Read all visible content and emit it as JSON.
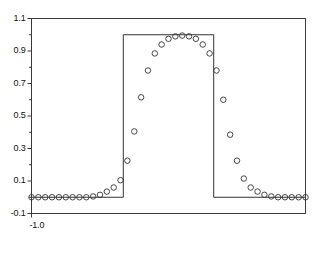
{
  "chart_data": {
    "type": "line",
    "title": "",
    "subtitle": "",
    "xlabel": "",
    "ylabel": "",
    "xlim": [
      -1.0,
      1.0
    ],
    "ylim": [
      -0.1,
      1.1
    ],
    "grid": false,
    "legend": "none",
    "frame": true,
    "y_ticks": [
      -0.1,
      0.1,
      0.3,
      0.5,
      0.7,
      0.9,
      1.1
    ],
    "y_tick_labels": [
      "-0.1",
      "0.1",
      "0.3",
      "0.5",
      "0.7",
      "0.9",
      "1.1"
    ],
    "y_minor_ticks": [
      0.0,
      0.2,
      0.4,
      0.6,
      0.8,
      1.0
    ],
    "x_ticks": [
      -1.0
    ],
    "x_tick_labels": [
      "-1.0"
    ],
    "series": [
      {
        "name": "square wave",
        "style": "line",
        "color": "#333333",
        "linewidth": 1,
        "x": [
          -1.0,
          -0.33,
          -0.33,
          0.33,
          0.33,
          1.0
        ],
        "values": [
          0.0,
          0.0,
          1.0,
          1.0,
          0.0,
          0.0
        ]
      },
      {
        "name": "approximation",
        "style": "markers",
        "marker": "circle-open",
        "color": "#333333",
        "marker_size": 4,
        "x": [
          -1.0,
          -0.95,
          -0.9,
          -0.85,
          -0.8,
          -0.75,
          -0.7,
          -0.65,
          -0.6,
          -0.55,
          -0.5,
          -0.45,
          -0.4,
          -0.35,
          -0.3,
          -0.25,
          -0.2,
          -0.15,
          -0.1,
          -0.05,
          0.0,
          0.05,
          0.1,
          0.15,
          0.2,
          0.25,
          0.3,
          0.35,
          0.4,
          0.45,
          0.5,
          0.55,
          0.6,
          0.65,
          0.7,
          0.75,
          0.8,
          0.85,
          0.9,
          0.95,
          1.0
        ],
        "values": [
          0.0,
          0.0,
          0.0,
          0.0,
          0.0,
          0.0,
          0.0,
          0.0,
          0.0,
          0.005,
          0.015,
          0.035,
          0.06,
          0.105,
          0.225,
          0.405,
          0.615,
          0.78,
          0.885,
          0.94,
          0.975,
          0.99,
          0.995,
          0.99,
          0.975,
          0.94,
          0.885,
          0.78,
          0.6,
          0.385,
          0.225,
          0.115,
          0.06,
          0.035,
          0.015,
          0.005,
          0.0,
          0.0,
          0.0,
          0.0,
          0.0
        ]
      }
    ]
  }
}
